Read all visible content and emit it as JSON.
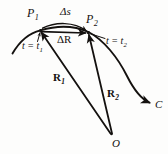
{
  "figure": {
    "background_color": "#fdfdfc",
    "ink_color": "#14110f",
    "labels": {
      "point_1": "P",
      "point_1_sub": "1",
      "point_2": "P",
      "point_2_sub": "2",
      "arc_length": "Δs",
      "displacement": "ΔR",
      "time_1": "t = t",
      "time_1_sub": "1",
      "time_2": "t = t",
      "time_2_sub": "2",
      "vector_r1": "R",
      "vector_r1_sub": "1",
      "vector_r2": "R",
      "vector_r2_sub": "2",
      "curve": "C",
      "origin": "O"
    },
    "geometry": {
      "origin_point": [
        112,
        135
      ],
      "p1_point": [
        40,
        30
      ],
      "p2_point": [
        88,
        33
      ],
      "curve_start": [
        12,
        53
      ],
      "curve_end": [
        152,
        103
      ]
    }
  }
}
